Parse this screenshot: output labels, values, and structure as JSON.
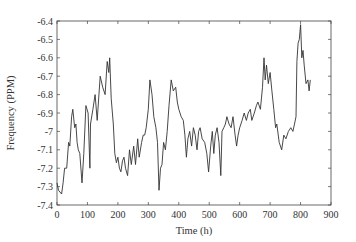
{
  "chart_data": {
    "type": "line",
    "title": "",
    "xlabel": "Time (h)",
    "ylabel": "Frequency (PPM)",
    "xlim": [
      0,
      900
    ],
    "ylim": [
      -7.4,
      -6.4
    ],
    "xticks": [
      0,
      100,
      200,
      300,
      400,
      500,
      600,
      700,
      800,
      900
    ],
    "yticks": [
      -6.4,
      -6.5,
      -6.6,
      -6.7,
      -6.8,
      -6.9,
      -7,
      -7.1,
      -7.2,
      -7.3,
      -7.4
    ],
    "ytick_labels": [
      "-6.4",
      "-6.5",
      "-6.6",
      "-6.7",
      "-6.8",
      "-6.9",
      "-7",
      "-7.1",
      "-7.2",
      "-7.3",
      "-7.4"
    ],
    "grid": false,
    "legend": null,
    "line_color": "#333333",
    "series": [
      {
        "name": "Frequency",
        "x": [
          0,
          5,
          15,
          20,
          25,
          32,
          38,
          42,
          48,
          52,
          58,
          62,
          66,
          70,
          75,
          82,
          88,
          95,
          102,
          108,
          110,
          118,
          125,
          132,
          142,
          150,
          158,
          165,
          170,
          173,
          178,
          185,
          190,
          195,
          200,
          205,
          210,
          215,
          220,
          225,
          232,
          238,
          244,
          252,
          258,
          265,
          270,
          278,
          283,
          288,
          293,
          300,
          305,
          312,
          318,
          325,
          330,
          335,
          340,
          345,
          350,
          356,
          362,
          368,
          375,
          382,
          390,
          395,
          400,
          408,
          415,
          420,
          425,
          430,
          436,
          442,
          448,
          454,
          460,
          465,
          470,
          477,
          485,
          492,
          498,
          505,
          510,
          515,
          520,
          526,
          532,
          538,
          542,
          548,
          553,
          558,
          565,
          572,
          578,
          585,
          590,
          595,
          600,
          608,
          615,
          622,
          628,
          635,
          640,
          648,
          655,
          660,
          668,
          675,
          680,
          684,
          688,
          694,
          700,
          706,
          712,
          718,
          722,
          730,
          738,
          745,
          752,
          760,
          768,
          775,
          780,
          785,
          788,
          792,
          796,
          800,
          804,
          808,
          812,
          818,
          824,
          828,
          832
        ],
        "y": [
          -7.28,
          -7.32,
          -7.34,
          -7.28,
          -7.2,
          -7.2,
          -7.06,
          -7.08,
          -6.92,
          -6.88,
          -6.98,
          -6.96,
          -7.06,
          -7.1,
          -7.12,
          -7.28,
          -7.12,
          -6.86,
          -6.9,
          -7.2,
          -6.96,
          -6.88,
          -6.8,
          -6.94,
          -6.7,
          -6.76,
          -6.8,
          -6.62,
          -6.68,
          -6.6,
          -6.82,
          -6.96,
          -7.12,
          -7.17,
          -7.14,
          -7.2,
          -7.22,
          -7.16,
          -7.14,
          -7.2,
          -7.24,
          -7.1,
          -7.18,
          -7.08,
          -7.18,
          -7.04,
          -7.14,
          -7.06,
          -7.02,
          -7.02,
          -6.98,
          -6.88,
          -6.72,
          -6.8,
          -6.92,
          -6.98,
          -7.06,
          -7.32,
          -7.2,
          -7.18,
          -7.06,
          -7.1,
          -7.0,
          -6.86,
          -6.72,
          -6.78,
          -6.76,
          -6.84,
          -6.88,
          -6.92,
          -6.94,
          -7.02,
          -7.14,
          -7.04,
          -7.0,
          -7.08,
          -6.98,
          -7.02,
          -7.1,
          -7.0,
          -6.98,
          -7.04,
          -7.06,
          -7.12,
          -7.22,
          -7.08,
          -7.0,
          -7.12,
          -7.02,
          -6.98,
          -7.06,
          -7.24,
          -7.0,
          -6.98,
          -6.96,
          -6.92,
          -6.96,
          -6.98,
          -6.92,
          -7.02,
          -7.08,
          -7.02,
          -6.98,
          -6.94,
          -6.9,
          -6.94,
          -6.9,
          -6.88,
          -6.94,
          -6.9,
          -6.86,
          -6.84,
          -6.88,
          -6.76,
          -6.6,
          -6.72,
          -6.64,
          -6.74,
          -6.68,
          -6.78,
          -6.88,
          -6.98,
          -6.96,
          -7.06,
          -7.1,
          -7.02,
          -7.04,
          -7.0,
          -6.98,
          -7.0,
          -6.96,
          -6.92,
          -6.62,
          -6.52,
          -6.5,
          -6.42,
          -6.6,
          -6.56,
          -6.64,
          -6.74,
          -6.72,
          -6.78,
          -6.72
        ]
      }
    ]
  }
}
